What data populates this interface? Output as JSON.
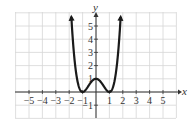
{
  "chart_data": {
    "type": "line",
    "title": "",
    "xlabel": "x",
    "ylabel": "y",
    "xlim": [
      -6,
      6
    ],
    "ylim": [
      -2,
      6
    ],
    "grid": true,
    "legend": null,
    "x_ticks": [
      -5,
      -4,
      -3,
      -2,
      -1,
      1,
      2,
      3,
      4,
      5
    ],
    "x_tick_labels": [
      "−5",
      "−4",
      "−3",
      "−2",
      "−1",
      "1",
      "2",
      "3",
      "4",
      "5"
    ],
    "y_ticks": [
      -1,
      1,
      2,
      3,
      4,
      5
    ],
    "y_tick_labels": [
      "−1",
      "1",
      "2",
      "3",
      "4",
      "5"
    ],
    "series": [
      {
        "name": "f(x)",
        "description": "Quartic curve with minima at (-1,0) and (1,0), local max at (0,1); arrows at both ends pointing up",
        "x": [
          -1.85,
          -1.75,
          -1.5,
          -1.25,
          -1.0,
          -0.75,
          -0.5,
          -0.25,
          0.0,
          0.25,
          0.5,
          0.75,
          1.0,
          1.25,
          1.5,
          1.75,
          1.85
        ],
        "y": [
          5.7,
          4.2,
          1.56,
          0.32,
          0.0,
          0.19,
          0.56,
          0.88,
          1.0,
          0.88,
          0.56,
          0.19,
          0.0,
          0.32,
          1.56,
          4.2,
          5.7
        ],
        "color": "#1a1a1a",
        "end_arrows": true
      }
    ],
    "key_points": [
      {
        "x": -1,
        "y": 0,
        "label": "minimum"
      },
      {
        "x": 0,
        "y": 1,
        "label": "local maximum"
      },
      {
        "x": 1,
        "y": 0,
        "label": "minimum"
      }
    ]
  },
  "colors": {
    "grid": "#d6d6d6",
    "axis": "#333333",
    "curve": "#1a1a1a",
    "text": "#333333"
  }
}
